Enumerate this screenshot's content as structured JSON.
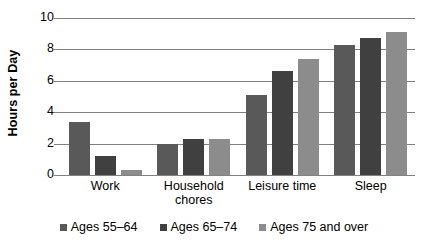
{
  "chart_data": {
    "type": "bar",
    "title": "",
    "xlabel": "",
    "ylabel": "Hours per Day",
    "ylim": [
      0,
      10
    ],
    "yticks": [
      0,
      2,
      4,
      6,
      8,
      10
    ],
    "ytick_labels": [
      "0",
      "2",
      "4",
      "6",
      "8",
      "10"
    ],
    "grid": true,
    "legend_position": "bottom",
    "categories": [
      "Work",
      "Household chores",
      "Leisure time",
      "Sleep"
    ],
    "category_lines": [
      [
        "Work"
      ],
      [
        "Household",
        "chores"
      ],
      [
        "Leisure time"
      ],
      [
        "Sleep"
      ]
    ],
    "series": [
      {
        "name": "Ages 55–64",
        "color": "#595959",
        "values": [
          3.4,
          2.0,
          5.1,
          8.3
        ]
      },
      {
        "name": "Ages 65–74",
        "color": "#404040",
        "values": [
          1.2,
          2.3,
          6.6,
          8.7
        ]
      },
      {
        "name": "Ages 75 and over",
        "color": "#8C8C8C",
        "values": [
          0.3,
          2.3,
          7.4,
          9.1
        ]
      }
    ]
  },
  "axis": {
    "y_title": "Hours per Day",
    "gridline_color": "#808080"
  }
}
